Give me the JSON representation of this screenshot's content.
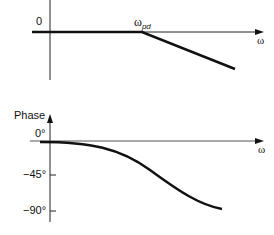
{
  "magnitude_plot": {
    "zero_label": "0",
    "break_label_main": "ω",
    "break_label_sub": "pd",
    "x_axis_label": "ω"
  },
  "phase_plot": {
    "y_axis_label": "Phase",
    "x_axis_label": "ω",
    "ticks": [
      {
        "label": "0°",
        "value": 0
      },
      {
        "label": "−45°",
        "value": -45
      },
      {
        "label": "−90°",
        "value": -90
      }
    ]
  },
  "colors": {
    "line": "#111111",
    "axis": "#222222"
  }
}
